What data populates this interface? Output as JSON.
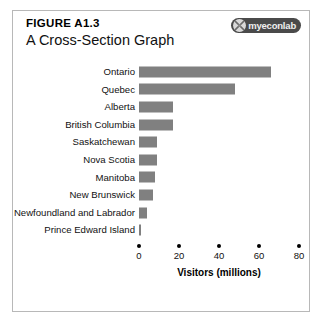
{
  "figure": {
    "number": "FIGURE A1.3",
    "title": "A Cross-Section Graph",
    "frame_border_color": "#b8b8b8"
  },
  "logo": {
    "text": "myeconlab",
    "icon": "myeconlab-mark-icon",
    "pill_color": "#4a4a4a",
    "text_color": "#efefef"
  },
  "chart_data": {
    "type": "bar",
    "orientation": "horizontal",
    "title": "A Cross-Section Graph",
    "xlabel": "Visitors (millions)",
    "ylabel": "",
    "categories": [
      "Ontario",
      "Quebec",
      "Alberta",
      "British Columbia",
      "Saskatchewan",
      "Nova Scotia",
      "Manitoba",
      "New Brunswick",
      "Newfoundland and Labrador",
      "Prince Edward Island"
    ],
    "values": [
      66,
      48,
      17,
      17,
      9,
      9,
      8,
      7,
      4,
      1
    ],
    "xlim": [
      0,
      85
    ],
    "xticks": [
      0,
      20,
      40,
      60,
      80
    ],
    "xticklabels": [
      "0",
      "20",
      "40",
      "60",
      "80"
    ],
    "grid": false,
    "legend": false,
    "bar_color": "#808080",
    "tick_marker": "dot"
  }
}
